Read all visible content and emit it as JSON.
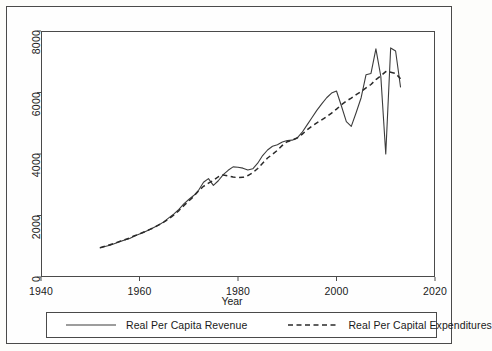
{
  "chart_data": {
    "type": "line",
    "title": "",
    "xlabel": "Year",
    "ylabel": "",
    "xlim": [
      1940,
      2020
    ],
    "ylim": [
      0,
      8000
    ],
    "xticks": [
      1940,
      1960,
      1980,
      2000,
      2020
    ],
    "yticks": [
      0,
      2000,
      4000,
      6000,
      8000
    ],
    "grid": false,
    "legend_position": "bottom",
    "series": [
      {
        "name": "Real Per Capita Revenue",
        "style": "solid",
        "color": "#3c3c3c",
        "x": [
          1952,
          1953,
          1954,
          1955,
          1956,
          1957,
          1958,
          1959,
          1960,
          1961,
          1962,
          1963,
          1964,
          1965,
          1966,
          1967,
          1968,
          1969,
          1970,
          1971,
          1972,
          1973,
          1974,
          1975,
          1976,
          1977,
          1978,
          1979,
          1980,
          1981,
          1982,
          1983,
          1984,
          1985,
          1986,
          1987,
          1988,
          1989,
          1990,
          1991,
          1992,
          1993,
          1994,
          1995,
          1996,
          1997,
          1998,
          1999,
          2000,
          2001,
          2002,
          2003,
          2004,
          2005,
          2006,
          2007,
          2008,
          2009,
          2010,
          2011,
          2012,
          2013
        ],
        "values": [
          950,
          990,
          1030,
          1090,
          1150,
          1200,
          1250,
          1330,
          1400,
          1460,
          1540,
          1620,
          1700,
          1800,
          1930,
          2050,
          2200,
          2380,
          2520,
          2650,
          2820,
          3080,
          3200,
          2980,
          3130,
          3330,
          3470,
          3580,
          3570,
          3540,
          3480,
          3520,
          3700,
          3950,
          4130,
          4250,
          4300,
          4390,
          4440,
          4450,
          4520,
          4700,
          4940,
          5180,
          5420,
          5630,
          5830,
          5980,
          6050,
          5560,
          5050,
          4900,
          5350,
          5830,
          6580,
          6620,
          7420,
          6520,
          4000,
          7450,
          7350,
          6180
        ]
      },
      {
        "name": "Real Per Capital Expenditures",
        "style": "dashed",
        "color": "#2a2a2a",
        "x": [
          1952,
          1953,
          1954,
          1955,
          1956,
          1957,
          1958,
          1959,
          1960,
          1961,
          1962,
          1963,
          1964,
          1965,
          1966,
          1967,
          1968,
          1969,
          1970,
          1971,
          1972,
          1973,
          1974,
          1975,
          1976,
          1977,
          1978,
          1979,
          1980,
          1981,
          1982,
          1983,
          1984,
          1985,
          1986,
          1987,
          1988,
          1989,
          1990,
          1991,
          1992,
          1993,
          1994,
          1995,
          1996,
          1997,
          1998,
          1999,
          2000,
          2001,
          2002,
          2003,
          2004,
          2005,
          2006,
          2007,
          2008,
          2009,
          2010,
          2011,
          2012,
          2013
        ],
        "values": [
          950,
          1000,
          1050,
          1100,
          1160,
          1210,
          1270,
          1340,
          1400,
          1470,
          1540,
          1610,
          1700,
          1790,
          1900,
          2020,
          2160,
          2320,
          2470,
          2620,
          2800,
          2950,
          3050,
          3140,
          3260,
          3320,
          3290,
          3250,
          3230,
          3240,
          3300,
          3390,
          3530,
          3700,
          3870,
          3990,
          4120,
          4280,
          4400,
          4450,
          4520,
          4640,
          4780,
          4900,
          5010,
          5110,
          5210,
          5330,
          5460,
          5600,
          5720,
          5820,
          5930,
          6030,
          6150,
          6260,
          6420,
          6540,
          6680,
          6660,
          6620,
          6450
        ]
      }
    ]
  },
  "axes": {
    "xtick_labels": [
      "1940",
      "1960",
      "1980",
      "2000",
      "2020"
    ],
    "ytick_labels": [
      "0",
      "2000",
      "4000",
      "6000",
      "8000"
    ],
    "xaxis_title": "Year"
  },
  "legend": {
    "entries": [
      {
        "label": "Real Per Capita Revenue",
        "style": "solid"
      },
      {
        "label": "Real Per Capital Expenditures",
        "style": "dashed"
      }
    ]
  }
}
